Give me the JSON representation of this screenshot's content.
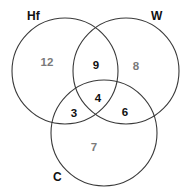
{
  "diagram": {
    "type": "venn-3",
    "sets": [
      {
        "id": "hf",
        "label": "Hf"
      },
      {
        "id": "w",
        "label": "W"
      },
      {
        "id": "c",
        "label": "C"
      }
    ],
    "regions": {
      "hf_only": "12",
      "w_only": "8",
      "c_only": "7",
      "hf_w": "9",
      "hf_c": "3",
      "w_c": "6",
      "hf_w_c": "4"
    },
    "colors": {
      "background": "#ffffff",
      "circle_stroke": "#3a3a3a",
      "label": "#111111",
      "intersection_value": "#111111",
      "exclusive_value": "#7a7a7a"
    }
  }
}
